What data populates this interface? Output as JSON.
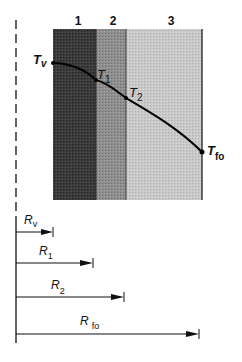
{
  "diagram": {
    "layers": [
      {
        "id": "1",
        "label": "1",
        "color": "#333333",
        "x0": 53,
        "x1": 96
      },
      {
        "id": "2",
        "label": "2",
        "color": "#8a8a8a",
        "x0": 96,
        "x1": 126
      },
      {
        "id": "3",
        "label": "3",
        "color": "#c6c6c6",
        "x0": 126,
        "x1": 202
      }
    ],
    "temperature_points": [
      {
        "id": "Tv",
        "main": "T",
        "sub": "v",
        "x": 53,
        "y": 63
      },
      {
        "id": "T1",
        "main": "T",
        "sub": "1",
        "x": 96,
        "y": 80
      },
      {
        "id": "T2",
        "main": "T",
        "sub": "2",
        "x": 126,
        "y": 98
      },
      {
        "id": "Tfo",
        "main": "T",
        "sub": "fo",
        "x": 202,
        "y": 152
      }
    ],
    "resistances": [
      {
        "id": "Rv",
        "main": "R",
        "sub": "v",
        "y": 232,
        "end_x": 53
      },
      {
        "id": "R1",
        "main": "R",
        "sub": "1",
        "y": 263,
        "end_x": 93
      },
      {
        "id": "R2",
        "main": "R",
        "sub": "2",
        "y": 297,
        "end_x": 124
      },
      {
        "id": "Rfo",
        "main": "R",
        "sub": "fo",
        "y": 334,
        "end_x": 199
      }
    ]
  }
}
